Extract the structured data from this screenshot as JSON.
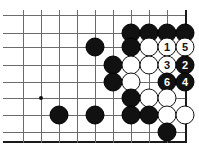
{
  "diagram": {
    "board": {
      "type": "go-board-partial",
      "cols": 10,
      "rows": 8,
      "cell_size": 18,
      "origin_x": 23,
      "origin_y": 15,
      "right_edge_col": 9,
      "bottom_edge_row": 7,
      "grid_color": "#6b6b6b",
      "edge_color": "#1a1a1a",
      "background": "#ffffff"
    },
    "star_points": [
      {
        "name": "star-point",
        "col": 1,
        "row": 4.6
      }
    ],
    "stones": [
      {
        "name": "stone-black-a",
        "color": "black",
        "col": 6,
        "row": 1,
        "label": ""
      },
      {
        "name": "stone-black-b",
        "color": "black",
        "col": 7,
        "row": 1,
        "label": ""
      },
      {
        "name": "stone-black-c",
        "color": "black",
        "col": 8,
        "row": 1,
        "label": ""
      },
      {
        "name": "stone-black-d",
        "color": "black",
        "col": 9,
        "row": 1,
        "label": ""
      },
      {
        "name": "stone-black-e",
        "color": "black",
        "col": 4,
        "row": 1.8,
        "label": ""
      },
      {
        "name": "stone-black-f",
        "color": "black",
        "col": 6,
        "row": 1.8,
        "label": ""
      },
      {
        "name": "stone-white-g",
        "color": "white",
        "col": 7,
        "row": 1.8,
        "label": ""
      },
      {
        "name": "stone-white-1",
        "color": "white",
        "col": 8,
        "row": 1.8,
        "label": "1"
      },
      {
        "name": "stone-white-5",
        "color": "white",
        "col": 9,
        "row": 1.8,
        "label": "5"
      },
      {
        "name": "stone-black-h",
        "color": "black",
        "col": 5,
        "row": 2.75,
        "label": ""
      },
      {
        "name": "stone-white-i",
        "color": "white",
        "col": 6,
        "row": 2.75,
        "label": ""
      },
      {
        "name": "stone-white-j",
        "color": "white",
        "col": 7,
        "row": 2.75,
        "label": ""
      },
      {
        "name": "stone-white-3",
        "color": "white",
        "col": 8,
        "row": 2.75,
        "label": "3"
      },
      {
        "name": "stone-black-2",
        "color": "black",
        "col": 9,
        "row": 2.75,
        "label": "2"
      },
      {
        "name": "stone-black-k",
        "color": "black",
        "col": 5,
        "row": 3.7,
        "label": ""
      },
      {
        "name": "stone-white-l",
        "color": "white",
        "col": 6,
        "row": 3.7,
        "label": ""
      },
      {
        "name": "stone-black-6",
        "color": "black",
        "col": 8,
        "row": 3.7,
        "label": "6"
      },
      {
        "name": "stone-black-4",
        "color": "black",
        "col": 9,
        "row": 3.7,
        "label": "4"
      },
      {
        "name": "stone-black-m",
        "color": "black",
        "col": 6,
        "row": 4.6,
        "label": ""
      },
      {
        "name": "stone-white-n",
        "color": "white",
        "col": 7,
        "row": 4.6,
        "label": ""
      },
      {
        "name": "stone-white-o",
        "color": "white",
        "col": 8,
        "row": 4.6,
        "label": ""
      },
      {
        "name": "stone-black-p",
        "color": "black",
        "col": 2,
        "row": 5.55,
        "label": ""
      },
      {
        "name": "stone-black-q",
        "color": "black",
        "col": 4,
        "row": 5.55,
        "label": ""
      },
      {
        "name": "stone-black-r",
        "color": "black",
        "col": 6,
        "row": 5.55,
        "label": ""
      },
      {
        "name": "stone-black-s",
        "color": "black",
        "col": 7,
        "row": 5.55,
        "label": ""
      },
      {
        "name": "stone-white-t",
        "color": "white",
        "col": 8,
        "row": 5.55,
        "label": ""
      },
      {
        "name": "stone-white-u",
        "color": "white",
        "col": 9,
        "row": 5.55,
        "label": ""
      },
      {
        "name": "stone-black-v",
        "color": "black",
        "col": 8,
        "row": 6.5,
        "label": ""
      }
    ],
    "move_sequence": [
      {
        "number": "1",
        "color": "white"
      },
      {
        "number": "2",
        "color": "black"
      },
      {
        "number": "3",
        "color": "white"
      },
      {
        "number": "4",
        "color": "black"
      },
      {
        "number": "5",
        "color": "white"
      },
      {
        "number": "6",
        "color": "black"
      }
    ]
  }
}
